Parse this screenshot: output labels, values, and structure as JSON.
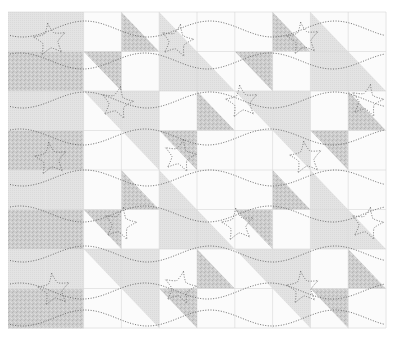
{
  "image": {
    "description": "Quilt pattern with half-square triangle blocks, stars and wavy dotted quilting lines",
    "width": 396,
    "height": 341
  },
  "colors": {
    "background": "#ffffff",
    "white_fabric": "#fbfbfb",
    "light_gray_fabric": "#e2e2e2",
    "textured_fabric": "#cdcdcd",
    "texture_speck": "#b0b0b0",
    "stitch": "#6e6e6e",
    "seam": "#d6d6d6"
  },
  "grid": {
    "x0": 8,
    "y0": 12,
    "cell_w": 37.8,
    "cell_h": 39.5,
    "cols": 10,
    "rows": 8,
    "legend": {
      "W": "white",
      "G": "light gray solid",
      "T": "textured solid",
      "gLL": "light gray lower-left triangle",
      "tLL": "textured lower-left triangle",
      "gUR": "light gray upper-right triangle",
      "tUR": "textured upper-right triangle"
    },
    "cells": [
      [
        "G",
        "G",
        "W",
        "tLL",
        "gLL",
        "W",
        "W",
        "tLL",
        "gLL",
        "W"
      ],
      [
        "T",
        "T",
        "tUR",
        "W",
        "G",
        "gLL",
        "tUR",
        "W",
        "G",
        "gLL"
      ],
      [
        "G",
        "G",
        "gUR",
        "G",
        "W",
        "tLL",
        "gUR",
        "G",
        "W",
        "tLL"
      ],
      [
        "T",
        "T",
        "W",
        "gUR",
        "tUR",
        "W",
        "W",
        "gUR",
        "tUR",
        "W"
      ],
      [
        "G",
        "G",
        "W",
        "tLL",
        "gLL",
        "W",
        "W",
        "tLL",
        "gLL",
        "W"
      ],
      [
        "T",
        "T",
        "tUR",
        "W",
        "G",
        "gLL",
        "tUR",
        "W",
        "G",
        "gLL"
      ],
      [
        "G",
        "G",
        "gUR",
        "G",
        "W",
        "tLL",
        "gUR",
        "G",
        "W",
        "tLL"
      ],
      [
        "T",
        "T",
        "W",
        "gUR",
        "tUR",
        "W",
        "W",
        "gUR",
        "tUR",
        "W"
      ]
    ]
  },
  "stars": [
    {
      "x": 50,
      "y": 40
    },
    {
      "x": 177,
      "y": 41
    },
    {
      "x": 303,
      "y": 39
    },
    {
      "x": 117,
      "y": 103
    },
    {
      "x": 242,
      "y": 102
    },
    {
      "x": 367,
      "y": 101
    },
    {
      "x": 51,
      "y": 159
    },
    {
      "x": 180,
      "y": 156
    },
    {
      "x": 306,
      "y": 158
    },
    {
      "x": 120,
      "y": 224
    },
    {
      "x": 238,
      "y": 225
    },
    {
      "x": 367,
      "y": 224
    },
    {
      "x": 54,
      "y": 290
    },
    {
      "x": 180,
      "y": 288
    },
    {
      "x": 303,
      "y": 288
    }
  ],
  "waves": {
    "x_start": 10,
    "x_end": 384,
    "period": 125,
    "amplitude": 8,
    "rows": [
      {
        "y": 29,
        "phase": 85
      },
      {
        "y": 61,
        "phase": 20
      },
      {
        "y": 100,
        "phase": 85
      },
      {
        "y": 137,
        "phase": 20
      },
      {
        "y": 178,
        "phase": 85
      },
      {
        "y": 214,
        "phase": 20
      },
      {
        "y": 254,
        "phase": 85
      },
      {
        "y": 291,
        "phase": 20
      },
      {
        "y": 318,
        "phase": 85
      }
    ]
  },
  "caption": ""
}
